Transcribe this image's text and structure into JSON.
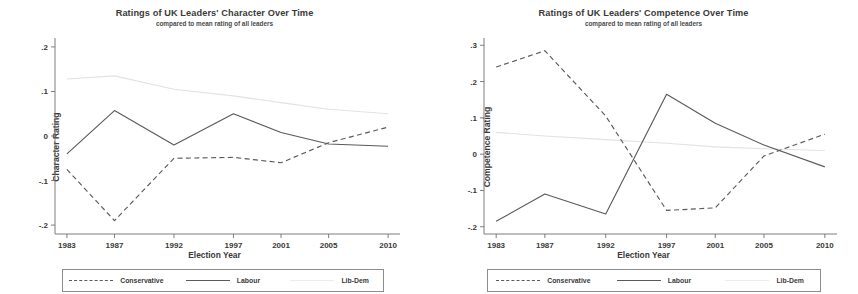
{
  "legend": {
    "entries": [
      {
        "label": "Conservative",
        "key": "dashed-line-key",
        "color": "#5a5a5a"
      },
      {
        "label": "Labour",
        "key": "solid-line-key",
        "color": "#5a5a5a"
      },
      {
        "label": "Lib-Dem",
        "key": "faint-line-key",
        "color": "#ededed"
      }
    ]
  },
  "chart_data": [
    {
      "type": "line",
      "panel": "left",
      "title": "Ratings of UK Leaders' Character Over Time",
      "subtitle": "compared to mean rating of all leaders",
      "xlabel": "Election Year",
      "ylabel": "Character Rating",
      "categories": [
        1983,
        1987,
        1992,
        1997,
        2001,
        2005,
        2010
      ],
      "xticklabels": [
        "1983",
        "1987",
        "1992",
        "1997",
        "2001",
        "2005",
        "2010"
      ],
      "yticks": [
        0.2,
        0.1,
        0,
        -0.1,
        -0.2
      ],
      "yticklabels": [
        ".2",
        ".1",
        "0",
        "-.1",
        "-.2"
      ],
      "ylim": [
        -0.22,
        0.22
      ],
      "xlim": [
        1982,
        2011
      ],
      "grid": false,
      "legend_position": "below",
      "series": [
        {
          "name": "Conservative",
          "style": "dashed",
          "color": "#5a5a5a",
          "values": [
            -0.075,
            -0.19,
            -0.05,
            -0.048,
            -0.06,
            -0.015,
            0.02
          ]
        },
        {
          "name": "Labour",
          "style": "solid",
          "color": "#5a5a5a",
          "values": [
            -0.04,
            0.057,
            -0.02,
            0.05,
            0.008,
            -0.018,
            -0.023
          ]
        },
        {
          "name": "Lib-Dem",
          "style": "solid-faint",
          "color": "#e2e2e2",
          "values": [
            0.128,
            0.135,
            0.105,
            0.09,
            0.075,
            0.06,
            0.05
          ]
        }
      ]
    },
    {
      "type": "line",
      "panel": "right",
      "title": "Ratings of UK Leaders' Competence Over Time",
      "subtitle": "compared to mean rating of all leaders",
      "xlabel": "Election Year",
      "ylabel": "Competence Rating",
      "categories": [
        1983,
        1987,
        1992,
        1997,
        2001,
        2005,
        2010
      ],
      "xticklabels": [
        "1983",
        "1987",
        "1992",
        "1997",
        "2001",
        "2005",
        "2010"
      ],
      "yticks": [
        0.3,
        0.2,
        0.1,
        0,
        -0.1,
        -0.2
      ],
      "yticklabels": [
        ".3",
        ".2",
        ".1",
        "0",
        "-.1",
        "-.2"
      ],
      "ylim": [
        -0.22,
        0.32
      ],
      "xlim": [
        1982,
        2011
      ],
      "grid": false,
      "legend_position": "below",
      "series": [
        {
          "name": "Conservative",
          "style": "dashed",
          "color": "#5a5a5a",
          "values": [
            0.24,
            0.285,
            0.105,
            -0.155,
            -0.148,
            -0.005,
            0.055
          ]
        },
        {
          "name": "Labour",
          "style": "solid",
          "color": "#5a5a5a",
          "values": [
            -0.185,
            -0.11,
            -0.165,
            0.165,
            0.085,
            0.025,
            -0.035
          ]
        },
        {
          "name": "Lib-Dem",
          "style": "solid-faint",
          "color": "#e2e2e2",
          "values": [
            0.06,
            0.05,
            0.04,
            0.03,
            0.02,
            0.015,
            0.01
          ]
        }
      ]
    }
  ]
}
